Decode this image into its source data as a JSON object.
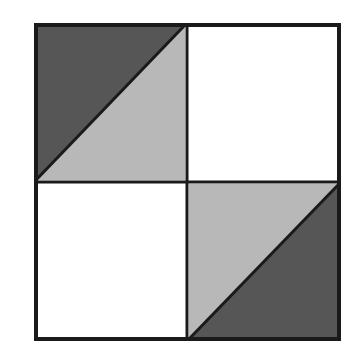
{
  "figure": {
    "title": "Two-by-two quadrant square with shaded triangles",
    "background_color": "#ffffff",
    "border_color": "#1a1a1a",
    "border_width": 4,
    "divider_color": "#1a1a1a",
    "divider_width": 3,
    "colors": {
      "dark_gray": "#565656",
      "light_gray": "#b8b8b8",
      "white": "#ffffff",
      "outline": "#1a1a1a"
    },
    "square": {
      "left": 34,
      "top": 23,
      "right": 341,
      "bottom": 341,
      "center_x": 187,
      "center_y": 182,
      "width": 307,
      "height": 318
    },
    "quadrants": [
      {
        "name": "top-left",
        "fill_mode": "split-diagonal",
        "diagonal": "anti-diagonal",
        "upper_left_fill": "#565656",
        "lower_right_fill": "#b8b8b8",
        "label": "Top left quadrant: dark gray upper triangle, light gray lower triangle"
      },
      {
        "name": "top-right",
        "fill_mode": "solid",
        "diagonal": "none",
        "upper_left_fill": "#ffffff",
        "lower_right_fill": "#ffffff",
        "label": "Top right quadrant: white"
      },
      {
        "name": "bottom-left",
        "fill_mode": "solid",
        "diagonal": "none",
        "upper_left_fill": "#ffffff",
        "lower_right_fill": "#ffffff",
        "label": "Bottom left quadrant: white"
      },
      {
        "name": "bottom-right",
        "fill_mode": "split-diagonal",
        "diagonal": "anti-diagonal",
        "upper_left_fill": "#b8b8b8",
        "lower_right_fill": "#565656",
        "label": "Bottom right quadrant: light gray upper triangle, dark gray lower triangle"
      }
    ]
  }
}
